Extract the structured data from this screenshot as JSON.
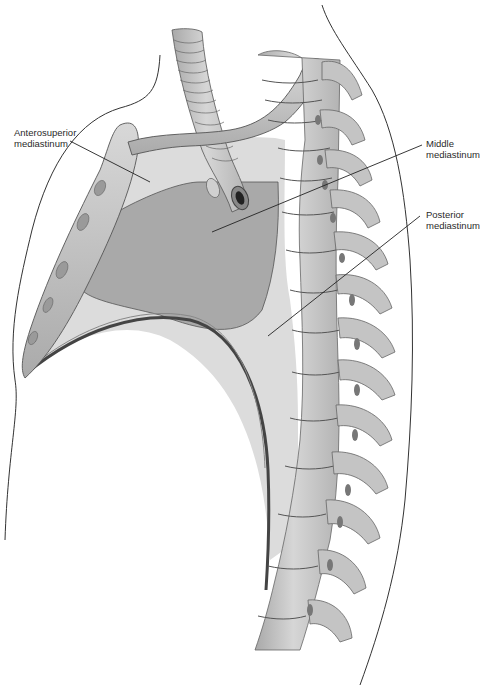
{
  "figure": {
    "labels": [
      {
        "id": "anterosuperior",
        "line1": "Anterosuperior",
        "line2": "mediastinum"
      },
      {
        "id": "middle",
        "line1": "Middle",
        "line2": "mediastinum"
      },
      {
        "id": "posterior",
        "line1": "Posterior",
        "line2": "mediastinum"
      }
    ],
    "colors": {
      "background": "#ffffff",
      "mediastinum_region": "#d9d9d9",
      "heart_region": "#a8a8a8",
      "bone": "#c8c8c8",
      "bone_shadow": "#9a9a9a",
      "diaphragm": "#555555",
      "outline": "#333333",
      "leader_line": "#222222"
    }
  }
}
